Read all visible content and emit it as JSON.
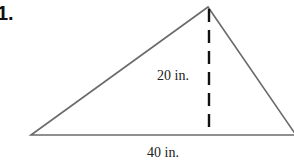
{
  "problem": {
    "number": "1."
  },
  "figure": {
    "shape": "triangle",
    "height_label": "20 in.",
    "base_label": "40 in.",
    "colors": {
      "stroke": "#6b6b6b",
      "dash": "#111111"
    }
  }
}
